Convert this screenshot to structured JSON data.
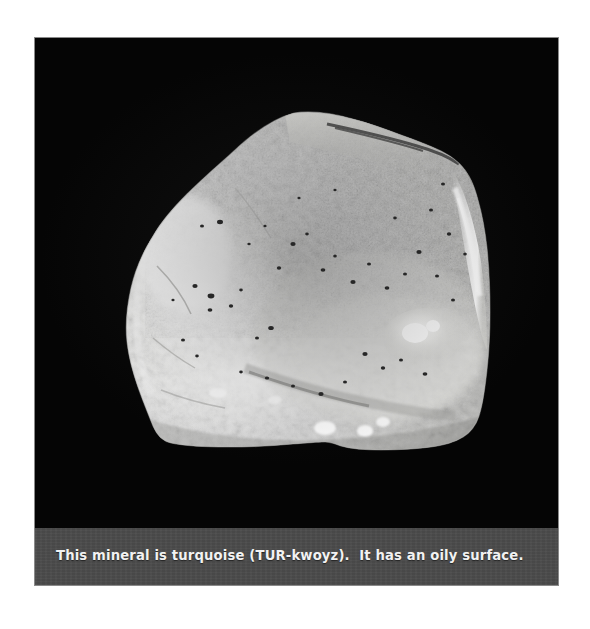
{
  "figure": {
    "kind": "photograph",
    "background_color": "#000000",
    "frame_border_color": "#8a8a8a"
  },
  "caption": {
    "text": "This mineral is turquoise (TUR-kwoyz).  It has an oily surface.",
    "band_color": "#4b4b4b",
    "text_color": "#f2f2f2"
  },
  "specimen": {
    "name": "turquoise",
    "pronunciation": "TUR-kwoyz",
    "surface_description": "oily surface",
    "rendering": {
      "body_light": "#f4f4f2",
      "body_mid": "#d0d0cd",
      "body_shadow": "#9a9a97",
      "highlight": "#ffffff",
      "speck_dark": "#2a2a2a"
    }
  }
}
